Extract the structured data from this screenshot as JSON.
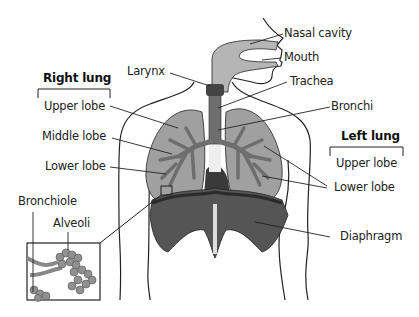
{
  "diagram": {
    "colors": {
      "outline": "#222222",
      "lung": "#a0a0a0",
      "airway": "#6e6e6e",
      "diaphragm": "#555555",
      "diaphragm_dark": "#3a3a3a",
      "larynx": "#444444",
      "nasal_passage": "#b5b5b5",
      "background": "#ffffff"
    },
    "groups": {
      "right_lung": {
        "title": "Right lung",
        "lobes": [
          "Upper lobe",
          "Middle lobe",
          "Lower lobe"
        ]
      },
      "left_lung": {
        "title": "Left lung",
        "lobes": [
          "Upper lobe",
          "Lower lobe"
        ]
      }
    },
    "labels": {
      "nasal_cavity": "Nasal cavity",
      "mouth": "Mouth",
      "larynx": "Larynx",
      "trachea": "Trachea",
      "bronchi": "Bronchi",
      "diaphragm": "Diaphragm",
      "bronchiole": "Bronchiole",
      "alveoli": "Alveoli"
    }
  }
}
